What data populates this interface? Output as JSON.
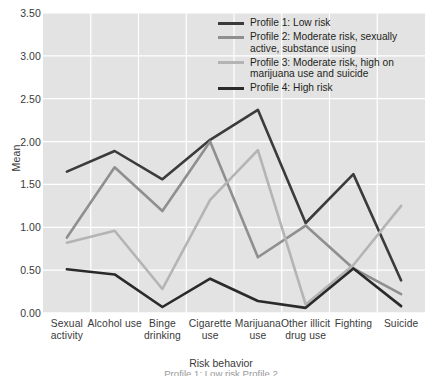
{
  "chart_data": {
    "type": "line",
    "title": "",
    "xlabel": "Risk behavior",
    "ylabel": "Mean",
    "ylim": [
      0.0,
      3.5
    ],
    "ytick_labels": [
      "0.00",
      "0.50",
      "1.00",
      "1.50",
      "2.00",
      "2.50",
      "3.00",
      "3.50"
    ],
    "ytick_values": [
      0.0,
      0.5,
      1.0,
      1.5,
      2.0,
      2.5,
      3.0,
      3.5
    ],
    "grid": true,
    "legend_position": "top-right",
    "categories": [
      "Sexual activity",
      "Alcohol use",
      "Binge drinking",
      "Cigarette use",
      "Marijuana use",
      "Other illicit drug use",
      "Fighting",
      "Suicide"
    ],
    "series": [
      {
        "name": "Profile 1: Low risk",
        "color": "#3b3b3b",
        "values": [
          1.65,
          1.89,
          1.56,
          2.02,
          2.37,
          1.05,
          1.62,
          0.38
        ]
      },
      {
        "name": "Profile 2: Moderate risk, sexually active, substance using",
        "color": "#8f8f8f",
        "values": [
          0.88,
          1.7,
          1.19,
          2.0,
          0.65,
          1.02,
          0.52,
          0.22
        ]
      },
      {
        "name": "Profile 3: Moderate risk, high on marijuana use and suicide",
        "color": "#b4b4b4",
        "values": [
          0.82,
          0.96,
          0.28,
          1.32,
          1.9,
          0.1,
          0.56,
          1.25
        ]
      },
      {
        "name": "Profile 4: High risk",
        "color": "#2a2a2a",
        "values": [
          0.51,
          0.45,
          0.07,
          0.4,
          0.14,
          0.06,
          0.52,
          0.08
        ]
      }
    ]
  },
  "axis": {
    "y_title": "Mean",
    "x_title": "Risk behavior"
  },
  "legend": {
    "entries": [
      {
        "label": "Profile 1: Low risk",
        "color": "#3b3b3b"
      },
      {
        "label": "Profile 2: Moderate risk, sexually active, substance using",
        "color": "#8f8f8f"
      },
      {
        "label": "Profile 3: Moderate risk, high on marijuana use and suicide",
        "color": "#b4b4b4"
      },
      {
        "label": "Profile 4: High risk",
        "color": "#2a2a2a"
      }
    ]
  },
  "caption_fragment": "Profile 1: Low risk     Profile 2"
}
